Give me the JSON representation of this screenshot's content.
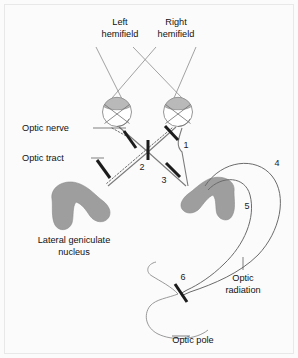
{
  "figure": {
    "background_color": "#fbfbfb",
    "border_color": "#e8e8e8",
    "width": 298,
    "height": 358
  },
  "labels": {
    "left_hemifield_line1": "Left",
    "left_hemifield_line2": "hemifield",
    "right_hemifield_line1": "Right",
    "right_hemifield_line2": "hemifield",
    "optic_nerve": "Optic nerve",
    "optic_tract": "Optic tract",
    "lgn_line1": "Lateral geniculate",
    "lgn_line2": "nucleus",
    "optic_radiation_line1": "Optic",
    "optic_radiation_line2": "radiation",
    "optic_pole": "Optic pole"
  },
  "lesion_markers": [
    {
      "id": "1",
      "label": "1",
      "site": "right-optic-nerve"
    },
    {
      "id": "2",
      "label": "2",
      "site": "optic-chiasm"
    },
    {
      "id": "3",
      "label": "3",
      "site": "right-optic-tract"
    },
    {
      "id": "4",
      "label": "4",
      "site": "optic-radiation-outer-loop"
    },
    {
      "id": "5",
      "label": "5",
      "site": "optic-radiation-inner-loop"
    },
    {
      "id": "6",
      "label": "6",
      "site": "optic-pole"
    }
  ],
  "structures": [
    {
      "name": "left-eye",
      "kind": "eyeball"
    },
    {
      "name": "right-eye",
      "kind": "eyeball"
    },
    {
      "name": "left-lateral-geniculate-nucleus",
      "kind": "nucleus",
      "color": "#9e9e9e"
    },
    {
      "name": "right-lateral-geniculate-nucleus",
      "kind": "nucleus",
      "color": "#9e9e9e"
    },
    {
      "name": "optic-chiasm",
      "kind": "crossing"
    },
    {
      "name": "optic-radiation",
      "kind": "fiber-loops"
    },
    {
      "name": "occipital-pole",
      "kind": "cortex-outline"
    }
  ],
  "colors": {
    "ink": "#111111",
    "line": "#7b7b7b",
    "lesion": "#1c1c1c",
    "nucleus_fill": "#9e9e9e",
    "lens_fill": "#b9b9b9"
  }
}
